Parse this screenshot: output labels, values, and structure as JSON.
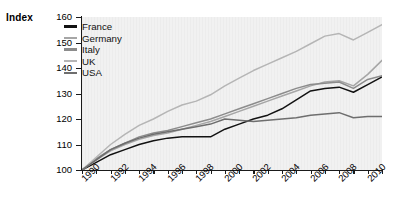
{
  "axis_label": "Index",
  "legend": {
    "entries": [
      {
        "label": "France",
        "color": "#121212"
      },
      {
        "label": "Germany",
        "color": "#a6a6a6"
      },
      {
        "label": "Italy",
        "color": "#8c8c8c"
      },
      {
        "label": "UK",
        "color": "#b5b5b5"
      },
      {
        "label": "USA",
        "color": "#6e6e6e"
      }
    ]
  },
  "chart_data": {
    "type": "line",
    "title": "",
    "xlabel": "",
    "ylabel": "Index",
    "xlim": [
      1990,
      2011
    ],
    "ylim": [
      100,
      160
    ],
    "ytick_labels": [
      "100",
      "110",
      "120",
      "130",
      "140",
      "150",
      "160"
    ],
    "yticks": [
      100,
      110,
      120,
      130,
      140,
      150,
      160
    ],
    "xtick_labels": [
      "1990",
      "1992",
      "1994",
      "1996",
      "1998",
      "2000",
      "2002",
      "2004",
      "2006",
      "2008",
      "2010"
    ],
    "xticks": [
      1990,
      1992,
      1994,
      1996,
      1998,
      2000,
      2002,
      2004,
      2006,
      2008,
      2010
    ],
    "grid": false,
    "legend_position": "top-left",
    "x": [
      1990,
      1991,
      1992,
      1993,
      1994,
      1995,
      1996,
      1997,
      1998,
      1999,
      2000,
      2001,
      2002,
      2003,
      2004,
      2005,
      2006,
      2007,
      2008,
      2009,
      2010,
      2011
    ],
    "series": [
      {
        "name": "France",
        "color": "#121212",
        "values": [
          100,
          103,
          106,
          108,
          110,
          111.5,
          112.5,
          113,
          113,
          113,
          116,
          118,
          120,
          121.5,
          124,
          127.5,
          131,
          132,
          132.5,
          130.5,
          133.5,
          136.5
        ]
      },
      {
        "name": "Germany",
        "color": "#a6a6a6",
        "values": [
          100,
          104,
          107.5,
          110,
          112,
          113.5,
          114.5,
          116,
          117.5,
          119,
          121,
          123,
          125,
          127,
          129,
          131,
          133,
          134.5,
          135,
          133,
          137.5,
          143
        ]
      },
      {
        "name": "Italy",
        "color": "#8c8c8c",
        "values": [
          100,
          104.5,
          108,
          110.5,
          113,
          114.5,
          115.5,
          117,
          118.5,
          120,
          122,
          124,
          126,
          128,
          130,
          132,
          133.5,
          134,
          134.5,
          132,
          135.5,
          137
        ]
      },
      {
        "name": "UK",
        "color": "#b5b5b5",
        "values": [
          100,
          105,
          110,
          114,
          117.5,
          120,
          123,
          125.5,
          127,
          129.5,
          133,
          136,
          139,
          141.5,
          144,
          146.5,
          149.5,
          152.5,
          153.5,
          151,
          154,
          157
        ]
      },
      {
        "name": "USA",
        "color": "#6e6e6e",
        "values": [
          100,
          104,
          108,
          110.5,
          112.5,
          114,
          115,
          116,
          117,
          118,
          120,
          119.5,
          119,
          119.5,
          120,
          120.5,
          121.5,
          122,
          122.5,
          120.5,
          121,
          121
        ]
      }
    ]
  }
}
